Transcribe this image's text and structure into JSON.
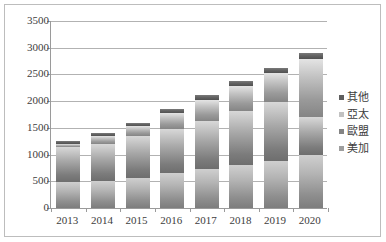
{
  "chart_data": {
    "type": "bar",
    "subtype": "stacked-column",
    "title": "",
    "xlabel": "",
    "ylabel": "",
    "categories": [
      "2013",
      "2014",
      "2015",
      "2016",
      "2017",
      "2018",
      "2019",
      "2020"
    ],
    "series": [
      {
        "name": "美加",
        "values": [
          480,
          500,
          570,
          650,
          730,
          800,
          880,
          1000
        ]
      },
      {
        "name": "歐盟",
        "values": [
          660,
          700,
          770,
          830,
          900,
          1020,
          1100,
          700
        ]
      },
      {
        "name": "亞太",
        "values": [
          60,
          145,
          195,
          300,
          400,
          470,
          550,
          1080
        ]
      },
      {
        "name": "其他",
        "values": [
          50,
          55,
          65,
          70,
          80,
          90,
          100,
          120
        ]
      }
    ],
    "totals": [
      1250,
      1400,
      1600,
      1850,
      2110,
      2380,
      2630,
      2900
    ],
    "ylim": [
      0,
      3500
    ],
    "yticks": [
      0,
      500,
      1000,
      1500,
      2000,
      2500,
      3000,
      3500
    ],
    "ytick_labels": [
      "0",
      "500",
      "1000",
      "1500",
      "2000",
      "2500",
      "3000",
      "3500"
    ],
    "grid": true,
    "legend_position": "right",
    "legend_order": [
      "其他",
      "亞太",
      "歐盟",
      "美加"
    ],
    "colors": {
      "其他": "#5e5e5e",
      "亞太": "#c2c2c2",
      "歐盟": "#848484",
      "美加": "#9e9e9e",
      "gridline": "#b2b2b2",
      "axis": "#9a9a9a",
      "border": "#bdbdbd",
      "background": "#ffffff",
      "text": "#3d3d3d"
    }
  },
  "legend": {
    "items": [
      {
        "label": "其他"
      },
      {
        "label": "亞太"
      },
      {
        "label": "歐盟"
      },
      {
        "label": "美加"
      }
    ]
  },
  "axes": {
    "y": {
      "labels": [
        "3500",
        "3000",
        "2500",
        "2000",
        "1500",
        "1000",
        "500",
        "0"
      ]
    },
    "x": {
      "labels": [
        "2013",
        "2014",
        "2015",
        "2016",
        "2017",
        "2018",
        "2019",
        "2020"
      ]
    }
  }
}
